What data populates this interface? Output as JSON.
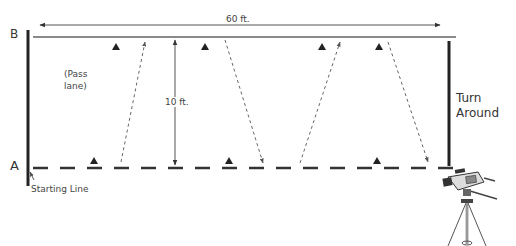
{
  "diagram": {
    "labels": {
      "point_b": "B",
      "point_a": "A",
      "length": "60 ft.",
      "width": "10 ft.",
      "pass_lane_line1": "(Pass",
      "pass_lane_line2": "lane)",
      "turn_around_line1": "Turn",
      "turn_around_line2": "Around",
      "starting_line": "Starting Line"
    },
    "dimensions": {
      "length_ft": 60,
      "width_ft": 10
    },
    "markers": {
      "top_line": [
        116,
        205,
        322,
        379
      ],
      "bottom_line": [
        94,
        229,
        377
      ]
    },
    "pass_paths": [
      {
        "from": "A",
        "to": "B",
        "direction": "up"
      },
      {
        "from": "B",
        "to": "A",
        "direction": "down"
      },
      {
        "from": "A",
        "to": "B",
        "direction": "up"
      },
      {
        "from": "B",
        "to": "A",
        "direction": "down"
      }
    ],
    "colors": {
      "line_dark": "#222222",
      "line_gray": "#8a8a8a",
      "dashed_path": "#666666",
      "text": "#444444"
    },
    "camera_icon": "video-camera-on-tripod"
  }
}
